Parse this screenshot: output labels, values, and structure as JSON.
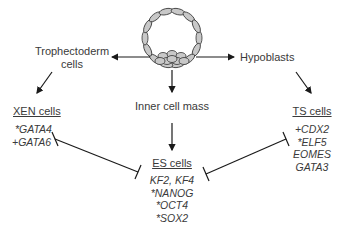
{
  "diagram": {
    "nodes": {
      "trophectoderm": {
        "line1": "Trophectoderm",
        "line2": "cells"
      },
      "hypoblasts": {
        "label": "Hypoblasts"
      },
      "icm": {
        "label": "Inner cell mass"
      },
      "xen": {
        "title": "XEN cells",
        "genes": [
          "*GATA4",
          "+GATA6"
        ]
      },
      "ts": {
        "title": "TS cells",
        "genes": [
          "+CDX2",
          "*ELF5",
          "EOMES",
          "GATA3"
        ]
      },
      "es": {
        "title": "ES cells",
        "genes": [
          "KF2, KF4",
          "*NANOG",
          "*OCT4",
          "*SOX2"
        ]
      }
    },
    "edges": [
      {
        "from": "blastocyst",
        "to": "trophectoderm",
        "type": "arrow"
      },
      {
        "from": "blastocyst",
        "to": "hypoblasts",
        "type": "arrow"
      },
      {
        "from": "blastocyst",
        "to": "icm",
        "type": "arrow"
      },
      {
        "from": "trophectoderm",
        "to": "xen",
        "type": "arrow"
      },
      {
        "from": "hypoblasts",
        "to": "ts",
        "type": "arrow"
      },
      {
        "from": "icm",
        "to": "es",
        "type": "arrow"
      },
      {
        "from": "xen",
        "to": "es",
        "type": "mutual-inhibition"
      },
      {
        "from": "ts",
        "to": "es",
        "type": "mutual-inhibition"
      }
    ],
    "colors": {
      "line": "#1a1a1a",
      "cell_fill": "#c8c8c8",
      "cell_stroke": "#333333",
      "text": "#3a3a3a"
    }
  }
}
